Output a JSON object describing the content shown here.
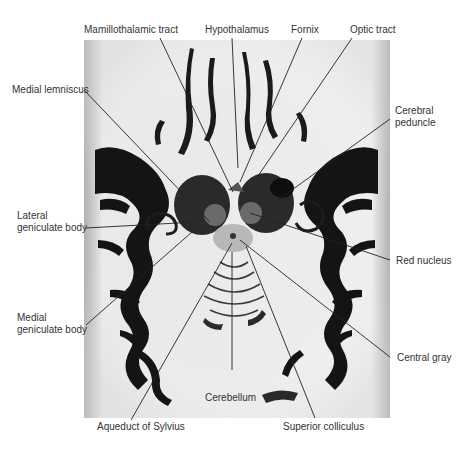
{
  "figure": {
    "colors": {
      "background": "#ffffff",
      "white_matter": "#f2f2f2",
      "gray_matter": "#141414",
      "label_text": "#333333",
      "leader_line": "#222222"
    }
  },
  "labels": {
    "mamillothalamic_tract": "Mamillothalamic tract",
    "hypothalamus": "Hypothalamus",
    "fornix": "Fornix",
    "optic_tract": "Optic tract",
    "medial_lemniscus": "Medial lemniscus",
    "cerebral_peduncle": "Cerebral\npeduncle",
    "lateral_geniculate_body": "Lateral\ngeniculate body",
    "red_nucleus": "Red nucleus",
    "medial_geniculate_body": "Medial\ngeniculate body",
    "central_gray": "Central gray",
    "cerebellum": "Cerebellum",
    "aqueduct_of_sylvius": "Aqueduct of Sylvius",
    "superior_colliculus": "Superior colliculus"
  }
}
